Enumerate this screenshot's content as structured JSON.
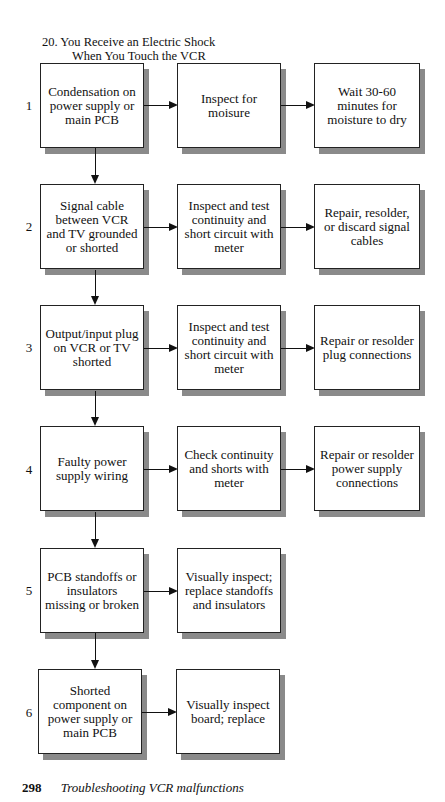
{
  "title": {
    "line1": "20. You Receive an Electric Shock",
    "line2": "When You Touch the VCR"
  },
  "rows": [
    {
      "number": "1",
      "cause": "Condensation on power supply or main PCB",
      "check": "Inspect for moisure",
      "remedy": "Wait 30-60 minutes for moisture to dry"
    },
    {
      "number": "2",
      "cause": "Signal cable between VCR and TV grounded or shorted",
      "check": "Inspect and test continuity and short circuit with meter",
      "remedy": "Repair, resolder, or discard signal cables"
    },
    {
      "number": "3",
      "cause": "Output/input plug on VCR or TV shorted",
      "check": "Inspect and test continuity and short circuit with meter",
      "remedy": "Repair or resolder plug connections"
    },
    {
      "number": "4",
      "cause": "Faulty power supply wiring",
      "check": "Check continuity and shorts with meter",
      "remedy": "Repair or resolder power supply connections"
    },
    {
      "number": "5",
      "cause": "PCB standoffs or insulators missing or broken",
      "check": "Visually inspect; replace standoffs and insulators",
      "remedy": ""
    },
    {
      "number": "6",
      "cause": "Shorted component on power supply or main PCB",
      "check": "Visually inspect board; replace",
      "remedy": ""
    }
  ],
  "footer": {
    "page_number": "298",
    "running_title": "Troubleshooting VCR malfunctions"
  }
}
